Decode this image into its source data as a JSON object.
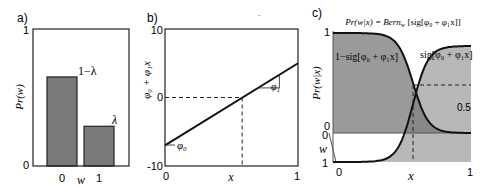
{
  "panels": {
    "a": {
      "label": "a)",
      "ylabel": "Pr(w)",
      "xlabel": "w",
      "yticks": [
        "0",
        "1"
      ],
      "xticks": [
        "0",
        "1"
      ],
      "bar_labels": [
        "1−λ",
        "λ"
      ]
    },
    "b": {
      "label": "b)",
      "ylabel": "φ₀ + φ₁x",
      "xlabel": "x",
      "yticks": [
        "10",
        "0",
        "-10"
      ],
      "xticks": [
        "0",
        "1"
      ],
      "annotation_intercept": "φ₀",
      "annotation_slope": "φ₁"
    },
    "c": {
      "label": "c)",
      "title": "Pr(w|x) = Bern_w [sig[φ₀ + φ₁x]]",
      "title_parts": {
        "lhs": "Pr(w|x) = Bern",
        "sub": "w",
        "rhs": " [sig[φ₀ + φ₁x]]"
      },
      "ylabel": "Pr(w|x)",
      "wlabel": "w",
      "xlabel": "x",
      "yticks_upper": [
        "1",
        "0"
      ],
      "yticks_lower": [
        "0",
        "1"
      ],
      "xticks": [
        "0",
        "1"
      ],
      "curve_label_left": "1−sig[φ₀ + φ₁x]",
      "curve_label_right": "sig[φ₀ + φ₁x]",
      "half_label": "0.5"
    }
  },
  "colors": {
    "bar_fill": "#7a7a7a",
    "shade_dark": "#9a9a9a",
    "shade_light": "#b8b8b8",
    "shade_overlap": "#888888",
    "line": "#111111"
  },
  "chart_data": [
    {
      "type": "bar",
      "title": "a)",
      "categories": [
        "0",
        "1"
      ],
      "values": [
        0.65,
        0.29
      ],
      "value_labels": [
        "1−λ",
        "λ"
      ],
      "xlabel": "w",
      "ylabel": "Pr(w)",
      "ylim": [
        0,
        1
      ]
    },
    {
      "type": "line",
      "title": "b)",
      "x": [
        0,
        1
      ],
      "series": [
        {
          "name": "φ₀ + φ₁x",
          "values": [
            -7,
            5
          ]
        }
      ],
      "zero_crossing_x": 0.58,
      "xlabel": "x",
      "ylabel": "φ₀ + φ₁x",
      "xlim": [
        0,
        1
      ],
      "ylim": [
        -10,
        10
      ]
    },
    {
      "type": "line",
      "title": "Pr(w|x) = Bern_w [sig[φ₀ + φ₁x]]",
      "x_range": [
        0,
        1
      ],
      "series": [
        {
          "name": "1−sig[φ₀ + φ₁x]",
          "function": "1 - sigmoid"
        },
        {
          "name": "sig[φ₀ + φ₁x]",
          "function": "sigmoid"
        }
      ],
      "sigmoid_center_x": 0.58,
      "sigmoid_steepness": 18,
      "threshold": 0.5,
      "xlabel": "x",
      "ylabel": "Pr(w|x)",
      "xlim": [
        0,
        1
      ],
      "ylim": [
        0,
        1
      ]
    }
  ]
}
